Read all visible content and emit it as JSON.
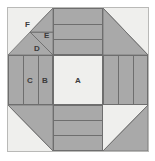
{
  "figure": {
    "type": "quilt-block-diagram",
    "title": "",
    "colors": {
      "background": "#ffffff",
      "light_patch": "#efefed",
      "medium_gray": "#a9a9a9",
      "dark_gray": "#8f8f8f",
      "outline": "#6e6e6e",
      "frame_border": "#b9b9b7",
      "label_text": "#3b3b3b"
    },
    "labels": [
      {
        "id": "A",
        "text": "A",
        "patch": "center-square",
        "x": 116,
        "y": 76
      },
      {
        "id": "B",
        "text": "B",
        "patch": "left-bar-inner-vertical",
        "x": 71,
        "y": 76
      },
      {
        "id": "C",
        "text": "C",
        "patch": "left-bar-middle-vertical",
        "x": 48,
        "y": 76
      },
      {
        "id": "D",
        "text": "D",
        "patch": "corner-triangle-lower",
        "x": 33,
        "y": 44
      },
      {
        "id": "E",
        "text": "E",
        "patch": "corner-triangle-upper",
        "x": 43,
        "y": 31
      },
      {
        "id": "F",
        "text": "F",
        "patch": "corner-background",
        "x": 24,
        "y": 20
      }
    ],
    "patches": {
      "center": {
        "name": "A",
        "shape": "square",
        "fill": "light_patch"
      },
      "side_bars": {
        "name": "B-C bars",
        "shape": "three-strips",
        "fill": "medium_gray",
        "strip_count": 3
      },
      "corner": {
        "name": "D-E-F corner unit",
        "shape": "triangles",
        "fills": [
          "medium_gray",
          "medium_gray",
          "light_patch"
        ]
      }
    },
    "grid": {
      "columns": [
        "corner",
        "bars",
        "corner"
      ],
      "rows": [
        "corner",
        "bars",
        "corner"
      ]
    }
  }
}
